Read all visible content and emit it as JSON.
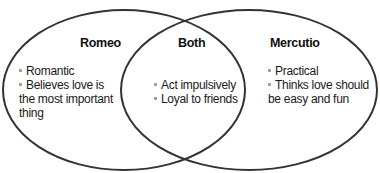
{
  "diagram": {
    "type": "venn",
    "colors": {
      "outline": "#333333",
      "bullet": "#999999",
      "text": "#111111"
    },
    "sets": [
      {
        "title": "Romeo",
        "items": [
          "Romantic",
          "Believes love is the most important thing"
        ]
      },
      {
        "title": "Both",
        "items": [
          "Act impulsively",
          "Loyal to friends"
        ]
      },
      {
        "title": "Mercutio",
        "items": [
          "Practical",
          "Thinks love should be easy and fun"
        ]
      }
    ],
    "romeo": {
      "title": "Romeo",
      "item1": "Romantic",
      "item2_l1": "Believes love is",
      "item2_l2": "the most important",
      "item2_l3": "thing"
    },
    "both": {
      "title": "Both",
      "item1": "Act impulsively",
      "item2": "Loyal to friends"
    },
    "mercutio": {
      "title": "Mercutio",
      "item1": "Practical",
      "item2_l1": "Thinks love should",
      "item2_l2": "be easy and fun"
    }
  }
}
